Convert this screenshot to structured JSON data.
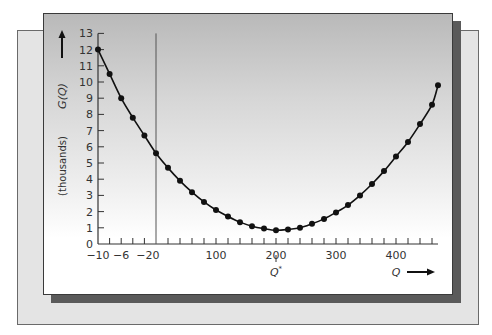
{
  "chart_data": {
    "type": "line",
    "title": "",
    "xlabel": "Q",
    "ylabel": "G(Q)",
    "ylabel_units": "(thousands)",
    "annotation": {
      "label": "Q*",
      "x": 200,
      "note": "minimizing value of Q"
    },
    "x_ticks_labels": [
      "-10",
      "-6",
      "-2",
      "0",
      "100",
      "200",
      "300",
      "400"
    ],
    "y_ticks_labels": [
      "0",
      "1",
      "2",
      "3",
      "4",
      "5",
      "6",
      "7",
      "8",
      "9",
      "10",
      "11",
      "12",
      "13"
    ],
    "ylim": [
      0,
      13
    ],
    "xlim": [
      -10,
      470
    ],
    "grid": false,
    "x_axis_note": "scale between -10 and 0 is expanded (broken axis)",
    "series": [
      {
        "name": "G(Q)",
        "marker": "circle",
        "x": [
          -10,
          -8,
          -6,
          -4,
          -2,
          0,
          20,
          40,
          60,
          80,
          100,
          120,
          140,
          160,
          180,
          200,
          220,
          240,
          260,
          280,
          300,
          320,
          340,
          360,
          380,
          400,
          420,
          440,
          460,
          470
        ],
        "y": [
          12.0,
          10.5,
          9.0,
          7.8,
          6.7,
          5.6,
          4.7,
          3.9,
          3.2,
          2.6,
          2.1,
          1.7,
          1.35,
          1.1,
          0.95,
          0.85,
          0.9,
          1.0,
          1.25,
          1.55,
          1.95,
          2.4,
          3.0,
          3.7,
          4.5,
          5.4,
          6.3,
          7.4,
          8.6,
          9.8
        ]
      }
    ]
  },
  "labels": {
    "y_title": "G(Q)",
    "y_units": "(thousands)",
    "x_title": "Q",
    "q_star": "Q",
    "q_star_sup": "*"
  },
  "colors": {
    "line": "#111111",
    "axis": "#333333",
    "shadow": "#5a5a5a",
    "back_panel": "#e4e4e4"
  }
}
